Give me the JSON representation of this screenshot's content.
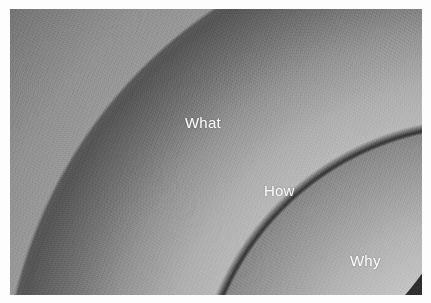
{
  "figure": {
    "name": "golden-circle-diagram",
    "background_color": "#fdfdfd",
    "canvas_color": "#100e0e",
    "label_color": "#ffffff"
  },
  "rings": [
    {
      "id": "what",
      "label": "What",
      "order": 1,
      "position": "outer",
      "edge_color": "#9c9c9c",
      "fill_color": "#4a4a4a"
    },
    {
      "id": "how",
      "label": "How",
      "order": 2,
      "position": "middle",
      "edge_color": "#bababa",
      "fill_color": "#606060"
    },
    {
      "id": "why",
      "label": "Why",
      "order": 3,
      "position": "inner",
      "edge_color": "#d6d6d6",
      "fill_color": "#8c8c8c"
    }
  ]
}
